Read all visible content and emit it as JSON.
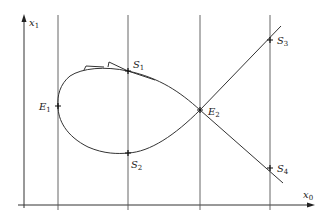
{
  "figure": {
    "axes": {
      "x_label": {
        "base": "x",
        "sub": "0"
      },
      "y_label": {
        "base": "x",
        "sub": "1"
      }
    },
    "points": [
      {
        "id": "E1",
        "base": "E",
        "sub": "1"
      },
      {
        "id": "S1",
        "base": "S",
        "sub": "1"
      },
      {
        "id": "S2",
        "base": "S",
        "sub": "2"
      },
      {
        "id": "E2",
        "base": "E",
        "sub": "2"
      },
      {
        "id": "S3",
        "base": "S",
        "sub": "3"
      },
      {
        "id": "S4",
        "base": "S",
        "sub": "4"
      }
    ],
    "colors": {
      "line": "#333333",
      "grid": "#555555",
      "background": "#ffffff"
    }
  }
}
